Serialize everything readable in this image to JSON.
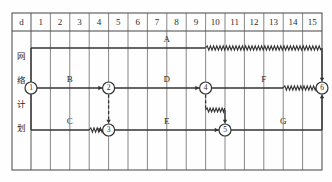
{
  "header": {
    "unit_label": "d",
    "days": [
      "1",
      "2",
      "3",
      "4",
      "5",
      "6",
      "7",
      "8",
      "9",
      "10",
      "11",
      "12",
      "13",
      "14",
      "15"
    ]
  },
  "side_label": {
    "text": "网络计划",
    "chars": [
      "网",
      "络",
      "计",
      "划"
    ]
  },
  "colors": {
    "line": "#333333",
    "grid": "#555555",
    "border": "#444444",
    "text": "#2a2a2a",
    "background": "#fefefe"
  },
  "nodes": [
    {
      "id": "1",
      "label": "1",
      "day": 0,
      "lane": "middle"
    },
    {
      "id": "2",
      "label": "2",
      "day": 4,
      "lane": "middle"
    },
    {
      "id": "3",
      "label": "3",
      "day": 4,
      "lane": "lower"
    },
    {
      "id": "4",
      "label": "4",
      "day": 9,
      "lane": "middle"
    },
    {
      "id": "5",
      "label": "5",
      "day": 10,
      "lane": "lower"
    },
    {
      "id": "6",
      "label": "6",
      "day": 15,
      "lane": "middle"
    }
  ],
  "activities": [
    {
      "name": "A",
      "from": "1",
      "to": "6",
      "lane": "top",
      "start_day": 0,
      "solid_end_day": 9,
      "end_day": 15,
      "float_days": 6,
      "label_day": 7.0,
      "has_float": true,
      "arrow": false
    },
    {
      "name": "B",
      "from": "1",
      "to": "2",
      "lane": "middle",
      "start_day": 0,
      "solid_end_day": 4,
      "end_day": 4,
      "float_days": 0,
      "label_day": 2.0,
      "has_float": false,
      "arrow": true
    },
    {
      "name": "C",
      "from": "1",
      "to": "3",
      "lane": "lower",
      "start_day": 0,
      "solid_end_day": 3,
      "end_day": 4,
      "float_days": 1,
      "label_day": 2.0,
      "has_float": true,
      "arrow": true
    },
    {
      "name": "D",
      "from": "2",
      "to": "4",
      "lane": "middle",
      "start_day": 4,
      "solid_end_day": 9,
      "end_day": 9,
      "float_days": 0,
      "label_day": 7.0,
      "has_float": false,
      "arrow": true
    },
    {
      "name": "E",
      "from": "3",
      "to": "5",
      "lane": "lower",
      "start_day": 4,
      "solid_end_day": 10,
      "end_day": 10,
      "float_days": 0,
      "label_day": 7.0,
      "has_float": false,
      "arrow": true
    },
    {
      "name": "F",
      "from": "4",
      "to": "6",
      "lane": "middle",
      "start_day": 9,
      "solid_end_day": 13,
      "end_day": 15,
      "float_days": 2,
      "label_day": 12.0,
      "has_float": true,
      "arrow": false
    },
    {
      "name": "G",
      "from": "5",
      "to": "6",
      "lane": "lower",
      "start_day": 10,
      "solid_end_day": 15,
      "end_day": 15,
      "float_days": 0,
      "label_day": 13.0,
      "has_float": false,
      "arrow": false
    }
  ],
  "dummy_links": [
    {
      "from": "2",
      "to": "3",
      "day": 4,
      "style": "dashed",
      "has_float": false
    },
    {
      "from": "4",
      "to": "5",
      "day": 9,
      "to_day": 10,
      "style": "dashed",
      "has_float": true
    }
  ]
}
